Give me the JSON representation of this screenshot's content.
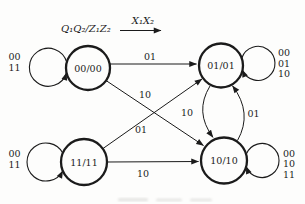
{
  "colors": {
    "ink": "#1b1b1b",
    "background": "#fdfdfc"
  },
  "figure": {
    "legend": {
      "state_format": "Q₁Q₂/Z₁Z₂",
      "input_format": "X₁X₂"
    },
    "states": [
      {
        "label": "00/00"
      },
      {
        "label": "01/01"
      },
      {
        "label": "11/11"
      },
      {
        "label": "10/10"
      }
    ],
    "self_loops": [
      {
        "state": "00/00",
        "inputs": [
          "00",
          "11"
        ]
      },
      {
        "state": "01/01",
        "inputs": [
          "00",
          "01",
          "10"
        ]
      },
      {
        "state": "11/11",
        "inputs": [
          "00",
          "11"
        ]
      },
      {
        "state": "10/10",
        "inputs": [
          "00",
          "10",
          "11"
        ]
      }
    ],
    "transitions": [
      {
        "from": "00/00",
        "to": "01/01",
        "label": "01"
      },
      {
        "from": "00/00",
        "to": "10/10",
        "label": "10"
      },
      {
        "from": "11/11",
        "to": "01/01",
        "label": "01"
      },
      {
        "from": "11/11",
        "to": "10/10",
        "label": "10"
      },
      {
        "from": "01/01",
        "to": "10/10",
        "label": "10"
      },
      {
        "from": "10/10",
        "to": "01/01",
        "label": "01"
      }
    ]
  }
}
